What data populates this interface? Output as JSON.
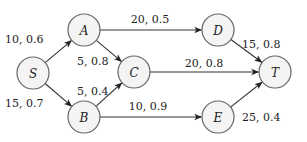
{
  "diagram": {
    "type": "directed-graph",
    "node_radius": 16,
    "colors": {
      "node_fill": "#f4f4f4",
      "node_stroke": "#666666",
      "edge": "#333333",
      "text": "#222222"
    },
    "nodes": [
      {
        "id": "S",
        "label": "S",
        "x": 33,
        "y": 73
      },
      {
        "id": "A",
        "label": "A",
        "x": 84,
        "y": 30
      },
      {
        "id": "B",
        "label": "B",
        "x": 84,
        "y": 117
      },
      {
        "id": "C",
        "label": "C",
        "x": 134,
        "y": 72
      },
      {
        "id": "D",
        "label": "D",
        "x": 218,
        "y": 30
      },
      {
        "id": "E",
        "label": "E",
        "x": 218,
        "y": 117
      },
      {
        "id": "T",
        "label": "T",
        "x": 275,
        "y": 72
      }
    ],
    "edges": [
      {
        "from": "S",
        "to": "A",
        "label": "10, 0.6",
        "lx": 5,
        "ly": 43,
        "anchor": "start"
      },
      {
        "from": "S",
        "to": "B",
        "label": "15, 0.7",
        "lx": 5,
        "ly": 107,
        "anchor": "start"
      },
      {
        "from": "A",
        "to": "C",
        "label": "5, 0.8",
        "lx": 77,
        "ly": 65,
        "anchor": "start"
      },
      {
        "from": "A",
        "to": "D",
        "label": "20, 0.5",
        "lx": 150,
        "ly": 23,
        "anchor": "middle"
      },
      {
        "from": "B",
        "to": "C",
        "label": "5, 0.4",
        "lx": 77,
        "ly": 95,
        "anchor": "start"
      },
      {
        "from": "B",
        "to": "E",
        "label": "10, 0.9",
        "lx": 148,
        "ly": 110,
        "anchor": "middle"
      },
      {
        "from": "C",
        "to": "T",
        "label": "20, 0.8",
        "lx": 204,
        "ly": 67,
        "anchor": "middle"
      },
      {
        "from": "D",
        "to": "T",
        "label": "15, 0.8",
        "lx": 242,
        "ly": 48,
        "anchor": "start"
      },
      {
        "from": "E",
        "to": "T",
        "label": "25, 0.4",
        "lx": 242,
        "ly": 121,
        "anchor": "start"
      }
    ]
  }
}
